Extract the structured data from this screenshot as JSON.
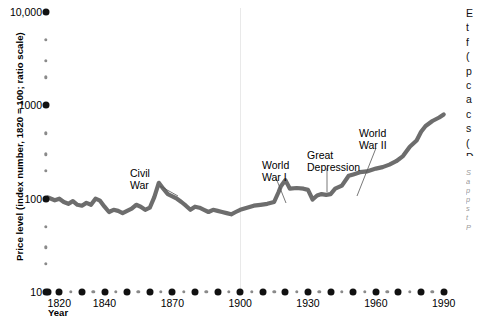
{
  "chart_data": {
    "type": "line",
    "title": "",
    "xlabel": "Year",
    "ylabel": "Price level (index number, 1820 = 100; ratio scale)",
    "yscale": "log",
    "ylim": [
      10,
      10000
    ],
    "xlim": [
      1815,
      1995
    ],
    "grid": false,
    "legend": null,
    "y_major_ticks": [
      10,
      100,
      1000,
      10000
    ],
    "y_major_tick_labels": [
      "10",
      "100",
      "1000",
      "10,000"
    ],
    "y_minor_ticks": [
      20,
      30,
      50,
      200,
      300,
      500,
      2000,
      3000,
      5000
    ],
    "x_ticks": [
      1820,
      1840,
      1870,
      1900,
      1930,
      1960,
      1990
    ],
    "x_tick_labels": [
      "1820",
      "1840",
      "1870",
      "1900",
      "1930",
      "1960",
      "1990"
    ],
    "x_major_dots": [
      1815,
      1820,
      1830,
      1840,
      1850,
      1860,
      1870,
      1880,
      1890,
      1900,
      1910,
      1920,
      1930,
      1940,
      1950,
      1960,
      1970,
      1980,
      1990
    ],
    "x_minor_dots": [
      1825,
      1835,
      1845,
      1855,
      1865,
      1875,
      1885,
      1895,
      1905,
      1915,
      1925,
      1935,
      1945,
      1955,
      1965,
      1975,
      1985
    ],
    "series": [
      {
        "name": "Price level",
        "color": "#6d6d6d",
        "x": [
          1815,
          1818,
          1820,
          1822,
          1824,
          1826,
          1828,
          1830,
          1832,
          1834,
          1836,
          1838,
          1840,
          1842,
          1844,
          1846,
          1848,
          1850,
          1852,
          1854,
          1856,
          1858,
          1860,
          1862,
          1864,
          1866,
          1868,
          1870,
          1872,
          1874,
          1876,
          1878,
          1880,
          1882,
          1884,
          1886,
          1888,
          1890,
          1892,
          1894,
          1896,
          1898,
          1900,
          1903,
          1906,
          1909,
          1912,
          1915,
          1917,
          1918,
          1920,
          1922,
          1925,
          1928,
          1930,
          1932,
          1934,
          1936,
          1938,
          1940,
          1942,
          1945,
          1948,
          1950,
          1953,
          1956,
          1960,
          1963,
          1966,
          1969,
          1972,
          1975,
          1978,
          1980,
          1982,
          1985,
          1988,
          1990
        ],
        "y": [
          103,
          96,
          100,
          92,
          88,
          94,
          86,
          84,
          90,
          86,
          100,
          95,
          82,
          72,
          76,
          74,
          70,
          74,
          78,
          86,
          82,
          76,
          80,
          104,
          148,
          128,
          112,
          106,
          100,
          92,
          84,
          76,
          82,
          80,
          76,
          72,
          76,
          74,
          72,
          70,
          68,
          72,
          76,
          80,
          84,
          86,
          88,
          92,
          118,
          136,
          158,
          128,
          130,
          128,
          124,
          98,
          108,
          112,
          110,
          112,
          128,
          138,
          176,
          182,
          192,
          196,
          210,
          218,
          232,
          252,
          286,
          360,
          420,
          520,
          600,
          680,
          740,
          800
        ]
      }
    ],
    "annotations": [
      {
        "label": "Civil\nWar",
        "text_x": 130,
        "text_y": 168,
        "leader": [
          [
            160,
            186
          ],
          [
            178,
            196
          ]
        ]
      },
      {
        "label": "World\nWar I",
        "text_x": 262,
        "text_y": 160,
        "leader": [
          [
            276,
            178
          ],
          [
            286,
            203
          ]
        ]
      },
      {
        "label": "Great\nDepression",
        "text_x": 307,
        "text_y": 150,
        "leader": [
          [
            327,
            168
          ],
          [
            327,
            192
          ]
        ]
      },
      {
        "label": "World\nWar II",
        "text_x": 359,
        "text_y": 128,
        "leader": [
          [
            376,
            148
          ],
          [
            357,
            196
          ]
        ]
      }
    ],
    "vertical_rule_year": 1900
  },
  "side_text": {
    "body": "E\nt\nf\n(\np\nc\na\nc\ns\n(\nD",
    "note": "S\na\np\np\ns\nt\nP"
  }
}
